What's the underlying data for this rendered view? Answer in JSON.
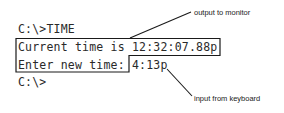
{
  "terminal": {
    "lines": [
      {
        "prompt": "C:\\>",
        "command": "TIME"
      },
      {
        "text": "Current time is 12:32:07.88p"
      },
      {
        "text": "Enter new time: ",
        "input": "4:13p"
      },
      {
        "prompt": "C:\\>"
      }
    ]
  },
  "annotations": {
    "output": "output to monitor",
    "input": "input from keyboard"
  },
  "colors": {
    "text": "#2a2a2a",
    "box": "#1a1a1a",
    "background": "#ffffff"
  }
}
